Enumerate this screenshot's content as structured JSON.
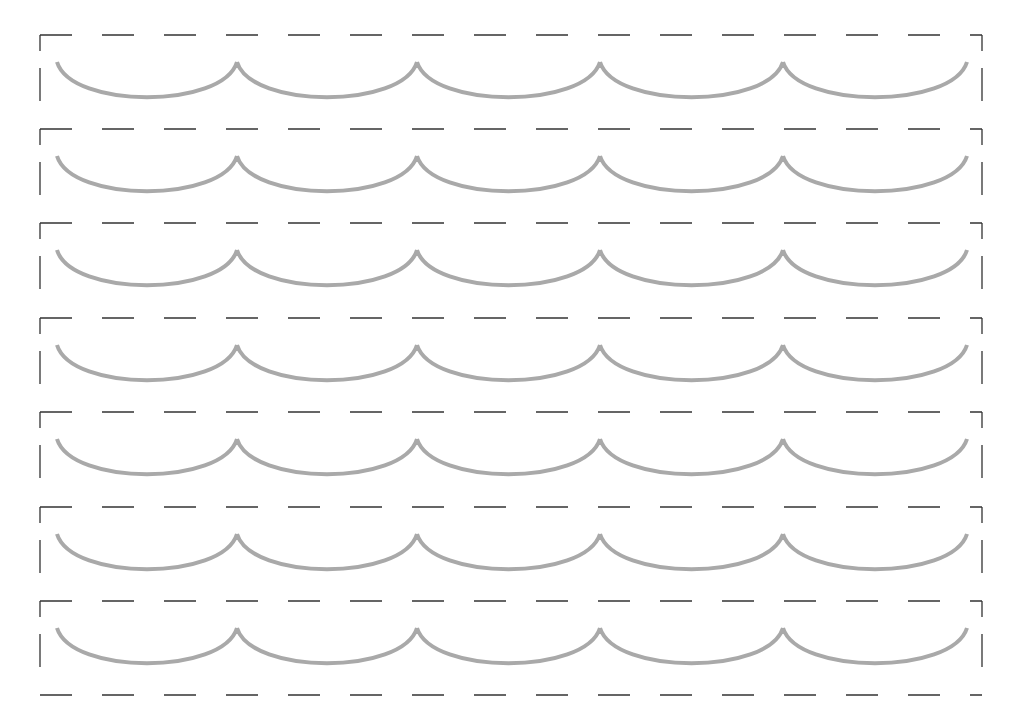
{
  "worksheet": {
    "type": "tracing-practice",
    "pattern": "scallop-arcs",
    "rows": 7,
    "arcs_per_row": 5,
    "colors": {
      "guide_line": "#333333",
      "trace_stroke": "#a9a9a9",
      "background": "#ffffff"
    },
    "row_lines_y": [
      35,
      129,
      223,
      318,
      412,
      507,
      601,
      695
    ],
    "cusps_x": [
      57,
      237,
      417,
      600,
      783,
      967
    ],
    "arc_top_offset": 27,
    "arc_depth": 45
  }
}
